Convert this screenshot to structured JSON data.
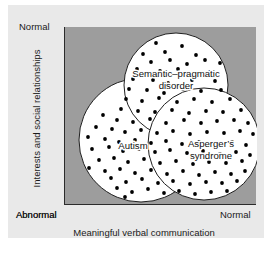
{
  "figure": {
    "title": "",
    "background_color": "#e9e9e9",
    "plot_background_color": "#9d9d9d"
  },
  "axes": {
    "x": {
      "title": "Meaningful verbal communication",
      "low_label": "Abnormal",
      "high_label": "Normal"
    },
    "y": {
      "title": "Interests and social relationships",
      "low_label": "Abnormal",
      "high_label": "Normal"
    }
  },
  "chart_data": {
    "type": "scatter",
    "title": "",
    "xlabel": "Meaningful verbal communication",
    "ylabel": "Interests and social relationships",
    "xlim": [
      0,
      192
    ],
    "ylim": [
      0,
      178
    ],
    "x_tick_labels": [
      "Abnormal",
      "Normal"
    ],
    "y_tick_labels": [
      "Abnormal",
      "Normal"
    ],
    "grid": false,
    "legend": "none",
    "annotation_style": "three-circle Venn diagram with scattered point cloud",
    "sets": [
      {
        "name": "Autism",
        "label": "Autism",
        "cx": 76,
        "cy": 113,
        "r": 62,
        "label_x": 68,
        "label_y": 122,
        "fill": "#ffffff",
        "stroke": "#1f1f1f"
      },
      {
        "name": "Semantic-pragmatic disorder",
        "label_line1": "Semantic–pragmatic",
        "label_line2": "disorder",
        "cx": 111,
        "cy": 58,
        "r": 52,
        "label_x": 111,
        "label_y": 50,
        "fill": "#ffffff",
        "stroke": "#1f1f1f"
      },
      {
        "name": "Asperger's syndrome",
        "label_line1": "Asperger’s",
        "label_line2": "syndrome",
        "cx": 139,
        "cy": 117,
        "r": 56,
        "label_x": 146,
        "label_y": 120,
        "fill": "#ffffff",
        "stroke": "#1f1f1f"
      }
    ],
    "points": [
      [
        109,
        7
      ],
      [
        128,
        10
      ],
      [
        91,
        16
      ],
      [
        117,
        19
      ],
      [
        143,
        16
      ],
      [
        152,
        21
      ],
      [
        78,
        27
      ],
      [
        100,
        25
      ],
      [
        131,
        28
      ],
      [
        160,
        26
      ],
      [
        86,
        35
      ],
      [
        105,
        33
      ],
      [
        122,
        37
      ],
      [
        140,
        33
      ],
      [
        155,
        36
      ],
      [
        167,
        33
      ],
      [
        72,
        42
      ],
      [
        95,
        44
      ],
      [
        113,
        42
      ],
      [
        145,
        45
      ],
      [
        163,
        44
      ],
      [
        175,
        43
      ],
      [
        68,
        52
      ],
      [
        88,
        53
      ],
      [
        103,
        56
      ],
      [
        127,
        53
      ],
      [
        150,
        54
      ],
      [
        170,
        52
      ],
      [
        182,
        56
      ],
      [
        64,
        62
      ],
      [
        82,
        63
      ],
      [
        99,
        66
      ],
      [
        118,
        62
      ],
      [
        136,
        64
      ],
      [
        156,
        63
      ],
      [
        173,
        66
      ],
      [
        188,
        64
      ],
      [
        61,
        72
      ],
      [
        77,
        74
      ],
      [
        94,
        71
      ],
      [
        112,
        75
      ],
      [
        129,
        72
      ],
      [
        147,
        75
      ],
      [
        165,
        72
      ],
      [
        180,
        75
      ],
      [
        190,
        73
      ],
      [
        44,
        60
      ],
      [
        30,
        72
      ],
      [
        56,
        82
      ],
      [
        73,
        84
      ],
      [
        90,
        85
      ],
      [
        107,
        83
      ],
      [
        124,
        86
      ],
      [
        141,
        84
      ],
      [
        158,
        85
      ],
      [
        176,
        83
      ],
      [
        186,
        86
      ],
      [
        20,
        84
      ],
      [
        38,
        88
      ],
      [
        52,
        93
      ],
      [
        68,
        95
      ],
      [
        85,
        92
      ],
      [
        101,
        96
      ],
      [
        119,
        93
      ],
      [
        136,
        96
      ],
      [
        152,
        94
      ],
      [
        169,
        93
      ],
      [
        183,
        96
      ],
      [
        14,
        95
      ],
      [
        31,
        100
      ],
      [
        47,
        102
      ],
      [
        60,
        105
      ],
      [
        76,
        103
      ],
      [
        92,
        106
      ],
      [
        108,
        104
      ],
      [
        125,
        107
      ],
      [
        142,
        105
      ],
      [
        159,
        106
      ],
      [
        175,
        104
      ],
      [
        188,
        107
      ],
      [
        23,
        110
      ],
      [
        40,
        112
      ],
      [
        54,
        115
      ],
      [
        70,
        113
      ],
      [
        86,
        116
      ],
      [
        101,
        114
      ],
      [
        117,
        117
      ],
      [
        134,
        115
      ],
      [
        150,
        118
      ],
      [
        167,
        115
      ],
      [
        181,
        118
      ],
      [
        10,
        118
      ],
      [
        27,
        122
      ],
      [
        44,
        120
      ],
      [
        58,
        124
      ],
      [
        74,
        122
      ],
      [
        90,
        125
      ],
      [
        105,
        123
      ],
      [
        122,
        126
      ],
      [
        138,
        124
      ],
      [
        155,
        127
      ],
      [
        171,
        125
      ],
      [
        185,
        128
      ],
      [
        17,
        130
      ],
      [
        34,
        133
      ],
      [
        49,
        131
      ],
      [
        63,
        135
      ],
      [
        79,
        132
      ],
      [
        95,
        136
      ],
      [
        111,
        134
      ],
      [
        128,
        137
      ],
      [
        144,
        135
      ],
      [
        161,
        136
      ],
      [
        177,
        134
      ],
      [
        24,
        141
      ],
      [
        40,
        144
      ],
      [
        55,
        142
      ],
      [
        70,
        146
      ],
      [
        86,
        143
      ],
      [
        102,
        147
      ],
      [
        118,
        144
      ],
      [
        134,
        148
      ],
      [
        150,
        145
      ],
      [
        166,
        147
      ],
      [
        180,
        144
      ],
      [
        14,
        149
      ],
      [
        30,
        153
      ],
      [
        46,
        151
      ],
      [
        61,
        155
      ],
      [
        77,
        152
      ],
      [
        93,
        156
      ],
      [
        108,
        154
      ],
      [
        125,
        157
      ],
      [
        141,
        155
      ],
      [
        157,
        156
      ],
      [
        172,
        154
      ],
      [
        21,
        160
      ],
      [
        37,
        163
      ],
      [
        52,
        161
      ],
      [
        67,
        165
      ],
      [
        83,
        162
      ],
      [
        99,
        166
      ],
      [
        114,
        164
      ],
      [
        130,
        167
      ],
      [
        146,
        165
      ],
      [
        162,
        164
      ],
      [
        176,
        162
      ],
      [
        29,
        170
      ],
      [
        45,
        172
      ],
      [
        60,
        170
      ],
      [
        76,
        173
      ],
      [
        91,
        171
      ],
      [
        107,
        174
      ],
      [
        122,
        172
      ],
      [
        138,
        173
      ],
      [
        153,
        171
      ],
      [
        168,
        170
      ],
      [
        38,
        178
      ],
      [
        54,
        177
      ],
      [
        69,
        179
      ],
      [
        85,
        177
      ],
      [
        100,
        178
      ],
      [
        116,
        176
      ],
      [
        131,
        177
      ],
      [
        147,
        175
      ]
    ]
  }
}
